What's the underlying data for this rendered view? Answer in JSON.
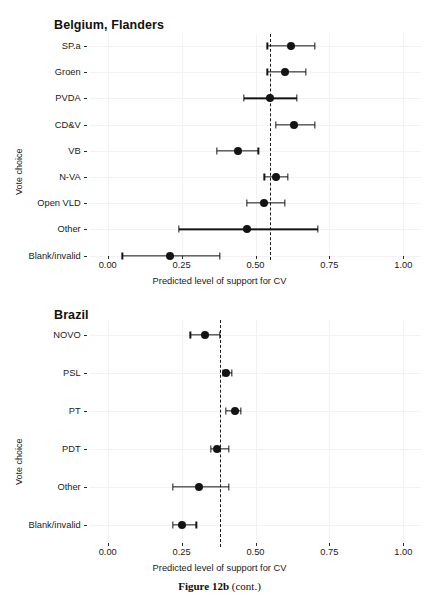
{
  "figure": {
    "caption_bold": "Figure 12b",
    "caption_rest": " (cont.)",
    "top_partial_text": ""
  },
  "chart_data": [
    {
      "type": "scatter",
      "title": "Belgium, Flanders",
      "xlabel": "Predicted level of support for CV",
      "ylabel": "Vote choice",
      "xlim": [
        0.0,
        1.0
      ],
      "xticks": [
        0.0,
        0.25,
        0.5,
        0.75,
        1.0
      ],
      "xticklabels": [
        "0.00",
        "0.25",
        "0.50",
        "0.75",
        "1.00"
      ],
      "grid": true,
      "legend": "none",
      "reference_line": {
        "value": 0.55,
        "style": "dashed"
      },
      "categories": [
        "SP.a",
        "Groen",
        "PVDA",
        "CD&V",
        "VB",
        "N-VA",
        "Open VLD",
        "Other",
        "Blank/invalid"
      ],
      "values": [
        0.62,
        0.6,
        0.55,
        0.63,
        0.44,
        0.57,
        0.53,
        0.47,
        0.21
      ],
      "ci_low": [
        0.54,
        0.54,
        0.46,
        0.57,
        0.37,
        0.53,
        0.47,
        0.24,
        0.05
      ],
      "ci_high": [
        0.7,
        0.67,
        0.64,
        0.7,
        0.51,
        0.61,
        0.6,
        0.71,
        0.38
      ]
    },
    {
      "type": "scatter",
      "title": "Brazil",
      "xlabel": "Predicted level of support for CV",
      "ylabel": "Vote choice",
      "xlim": [
        0.0,
        1.0
      ],
      "xticks": [
        0.0,
        0.25,
        0.5,
        0.75,
        1.0
      ],
      "xticklabels": [
        "0.00",
        "0.25",
        "0.50",
        "0.75",
        "1.00"
      ],
      "grid": true,
      "legend": "none",
      "reference_line": {
        "value": 0.38,
        "style": "dashed"
      },
      "categories": [
        "NOVO",
        "PSL",
        "PT",
        "PDT",
        "Other",
        "Blank/invalid"
      ],
      "values": [
        0.33,
        0.4,
        0.43,
        0.37,
        0.31,
        0.25
      ],
      "ci_low": [
        0.28,
        0.39,
        0.4,
        0.35,
        0.22,
        0.22
      ],
      "ci_high": [
        0.38,
        0.42,
        0.45,
        0.41,
        0.41,
        0.3
      ]
    }
  ]
}
